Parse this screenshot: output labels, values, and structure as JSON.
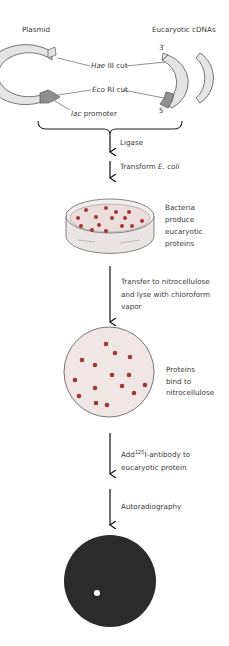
{
  "title_labels": {
    "plasmid": "Plasmid",
    "cdnas": "Eucaryotic cDNAs",
    "three_prime": "3′",
    "five_prime": "5′"
  },
  "cut_labels": {
    "hae_italic": "Hae",
    "hae_rest": " III cut",
    "eco_italic": "Eco",
    "eco_rest": " RI cut",
    "lac_italic": "lac",
    "lac_rest": " promoter"
  },
  "steps": {
    "ligase": "Ligase",
    "transform_prefix": "Transform ",
    "transform_italic": "E. coli",
    "bacteria_line1": "Bacteria",
    "bacteria_line2": "produce",
    "bacteria_line3": "eucaryotic",
    "bacteria_line4": "proteins",
    "transfer_line1": "Transfer to nitrocellulose",
    "transfer_line2": "and lyse with chloroform",
    "transfer_line3": "vapor",
    "proteins_line1": "Proteins",
    "proteins_line2": "bind to",
    "proteins_line3": "nitrocellulose",
    "add_prefix": "Add",
    "add_sup": "125",
    "add_rest": "I-antibody to",
    "add_line2": "eucaryotic protein",
    "autorad": "Autoradiography"
  },
  "colors": {
    "dna_fill": "#e4e4e4",
    "promoter_fill": "#8f8f8f",
    "dish_fill": "#efe4e4",
    "colony": "#9c3a35",
    "film": "#2b2b2b"
  }
}
